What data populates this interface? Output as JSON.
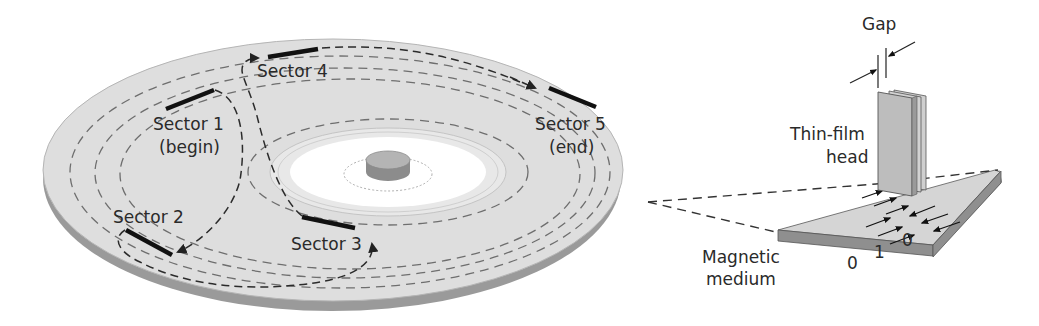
{
  "figure": {
    "disk": {
      "sectors": [
        {
          "id": 1,
          "label": "Sector 1",
          "note": "(begin)"
        },
        {
          "id": 2,
          "label": "Sector 2",
          "note": ""
        },
        {
          "id": 3,
          "label": "Sector 3",
          "note": ""
        },
        {
          "id": 4,
          "label": "Sector 4",
          "note": ""
        },
        {
          "id": 5,
          "label": "Sector 5",
          "note": "(end)"
        }
      ]
    },
    "head": {
      "gap_label": "Gap",
      "head_label_line1": "Thin-film",
      "head_label_line2": "head"
    },
    "medium": {
      "label_line1": "Magnetic",
      "label_line2": "medium",
      "bits": [
        "0",
        "1",
        "0"
      ]
    },
    "colors": {
      "disk_surface": "#dcdcdc",
      "disk_rim": "#9a9a9a",
      "hub": "#ffffff",
      "spindle_top": "#b4b4b4",
      "spindle_side": "#8c8c8c",
      "sector_mark": "#111111",
      "text": "#2a2a2a"
    }
  }
}
